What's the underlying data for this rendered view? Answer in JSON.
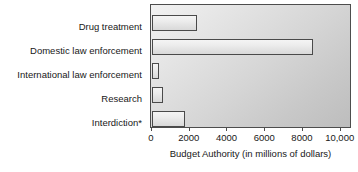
{
  "chart_data": {
    "type": "bar",
    "orientation": "horizontal",
    "title": "",
    "xlabel": "Budget Authority (in millions of dollars)",
    "ylabel": "",
    "categories": [
      "Drug treatment",
      "Domestic law enforcement",
      "International law enforcement",
      "Research",
      "Interdiction*"
    ],
    "values": [
      2400,
      8550,
      370,
      575,
      1725
    ],
    "xlim": [
      0,
      10600
    ],
    "xticks": [
      0,
      2000,
      4000,
      6000,
      8000,
      10000
    ],
    "xtick_labels": [
      "0",
      "2000",
      "4000",
      "6000",
      "8000",
      "10,000"
    ],
    "grid": false,
    "legend": null,
    "series": [
      {
        "name": "Budget Authority",
        "values": [
          2400,
          8550,
          370,
          575,
          1725
        ]
      }
    ],
    "annotations": [
      "* asterisk on Interdiction category label"
    ]
  },
  "style": {
    "bar_fill": "#ededed",
    "bar_border": "#4a4a4a",
    "plot_background_light": "#f2f2f2",
    "plot_background_dark": "#bdbdbd",
    "axis_color": "#4d4d4d",
    "text_color": "#181818"
  }
}
